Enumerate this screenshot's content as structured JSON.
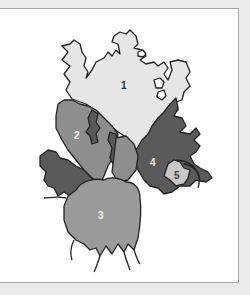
{
  "figure": {
    "type": "diagram",
    "regions": [
      {
        "id": 1,
        "label": "1",
        "fill": "#e6e6e6",
        "label_color": "#333333"
      },
      {
        "id": 2,
        "label": "2",
        "fill": "#8e8e8e",
        "label_color": "#ffffff"
      },
      {
        "id": 3,
        "label": "3",
        "fill": "#9a9a9a",
        "label_color": "#f0f0f0"
      },
      {
        "id": 4,
        "label": "4",
        "fill": "#5a5a5a",
        "label_color": "#e6e6e6"
      },
      {
        "id": 5,
        "label": "5",
        "fill": "#c8c8c8",
        "label_color": "#444444"
      }
    ]
  },
  "colors": {
    "background": "#ebebeb",
    "panel": "#ffffff",
    "panel_border": "#a9a9a9",
    "outline": "#222222"
  }
}
